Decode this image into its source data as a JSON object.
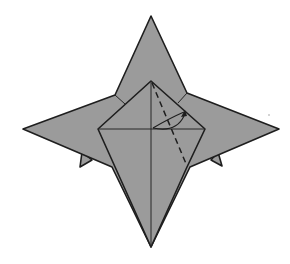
{
  "diagram": {
    "colors": {
      "paper": "#9b9b9b",
      "line": "#1e1e1e",
      "background": "#ffffff"
    },
    "points": {
      "top": [
        151,
        16
      ],
      "left": [
        23,
        129
      ],
      "right": [
        279,
        129
      ],
      "bottom": [
        151,
        247
      ],
      "kite_top": [
        151,
        81
      ],
      "kite_left": [
        98,
        129
      ],
      "kite_right": [
        205,
        129
      ]
    },
    "elements": [
      {
        "name": "outer-star",
        "type": "shape"
      },
      {
        "name": "center-kite-flap",
        "type": "shape"
      },
      {
        "name": "vertical-crease",
        "type": "solid-line"
      },
      {
        "name": "horizontal-crease",
        "type": "solid-line"
      },
      {
        "name": "valley-fold-line",
        "type": "dashed-line"
      },
      {
        "name": "fold-arrow",
        "type": "curved-arrow"
      },
      {
        "name": "left-small-spike",
        "type": "shape"
      },
      {
        "name": "right-small-spike",
        "type": "shape"
      }
    ]
  }
}
